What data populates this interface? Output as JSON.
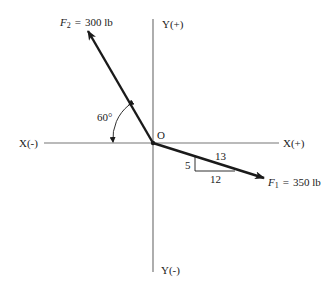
{
  "diagram": {
    "type": "force-vector-diagram",
    "origin_label": "O",
    "axes": {
      "x_positive": "X(+)",
      "x_negative": "X(-)",
      "y_positive": "Y(+)",
      "y_negative": "Y(-)"
    },
    "forces": [
      {
        "name": "F2",
        "symbol": "F",
        "subscript": "2",
        "equals": "=",
        "magnitude": "300 lb",
        "angle_label": "60°",
        "angle_reference": "measured from X(-) axis"
      },
      {
        "name": "F1",
        "symbol": "F",
        "subscript": "1",
        "equals": "=",
        "magnitude": "350 lb",
        "slope_triangle": {
          "rise": "5",
          "run": "12",
          "hypotenuse": "13"
        }
      }
    ]
  }
}
